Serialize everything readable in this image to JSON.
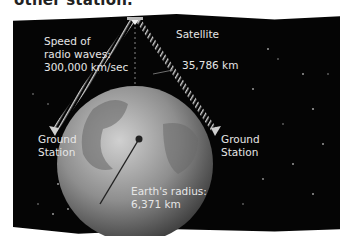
{
  "heading": {
    "text": "other station."
  },
  "diagram": {
    "satellite_label": "Satellite",
    "altitude_label": "35,786 km",
    "speed_label_lines": [
      "Speed of",
      "radio waves:",
      "300,000 km/sec"
    ],
    "ground_station_left_lines": [
      "Ground",
      "Station"
    ],
    "ground_station_right_lines": [
      "Ground",
      "Station"
    ],
    "earth_radius_lines": [
      "Earth's radius:",
      "6,371 km"
    ]
  },
  "colors": {
    "background": "#050505",
    "text": "#e6e6e6",
    "earth": "#8a8a8a",
    "beam": "#bdbdbd"
  }
}
